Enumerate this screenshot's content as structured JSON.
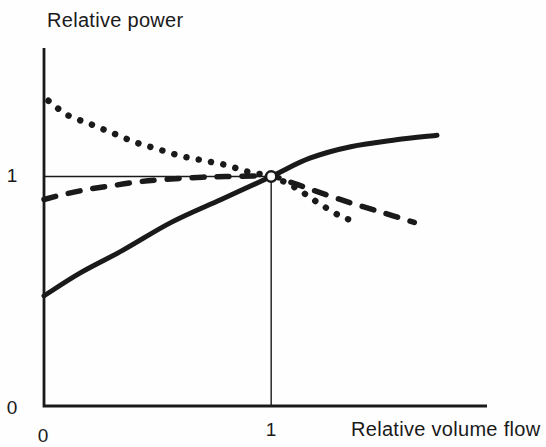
{
  "colors": {
    "ink": "#1a1a1a",
    "background": "#fefefe",
    "marker_fill": "#ffffff"
  },
  "chart_data": {
    "type": "line",
    "title": "",
    "ylabel": "Relative power",
    "xlabel": "Relative volume flow",
    "xlim": [
      0,
      1.95
    ],
    "ylim": [
      0,
      1.56
    ],
    "grid": false,
    "legend": "none",
    "x_ticks": [
      {
        "value": 0,
        "label": "0"
      },
      {
        "value": 1,
        "label": "1"
      }
    ],
    "y_ticks": [
      {
        "value": 0,
        "label": "0"
      },
      {
        "value": 1,
        "label": "1"
      }
    ],
    "reference_lines": [
      {
        "type": "horizontal",
        "y": 1,
        "from_x": 0,
        "to_x": 1
      },
      {
        "type": "vertical",
        "x": 1,
        "from_y": 0,
        "to_y": 1
      }
    ],
    "marker": {
      "x": 1,
      "y": 1,
      "shape": "open-circle"
    },
    "series": [
      {
        "name": "dotted curve",
        "style": "dotted",
        "points": [
          [
            0.02,
            1.33
          ],
          [
            0.1,
            1.27
          ],
          [
            0.2,
            1.23
          ],
          [
            0.3,
            1.19
          ],
          [
            0.4,
            1.15
          ],
          [
            0.5,
            1.12
          ],
          [
            0.6,
            1.09
          ],
          [
            0.7,
            1.07
          ],
          [
            0.8,
            1.05
          ],
          [
            0.9,
            1.02
          ],
          [
            1.0,
            1.0
          ],
          [
            1.1,
            0.955
          ],
          [
            1.2,
            0.89
          ],
          [
            1.3,
            0.83
          ],
          [
            1.38,
            0.8
          ]
        ]
      },
      {
        "name": "dashed curve",
        "style": "dashed",
        "points": [
          [
            0,
            0.9
          ],
          [
            0.1,
            0.925
          ],
          [
            0.2,
            0.945
          ],
          [
            0.3,
            0.96
          ],
          [
            0.4,
            0.975
          ],
          [
            0.5,
            0.985
          ],
          [
            0.65,
            0.995
          ],
          [
            0.8,
            1.0
          ],
          [
            1.0,
            1.0
          ],
          [
            1.1,
            0.97
          ],
          [
            1.2,
            0.935
          ],
          [
            1.35,
            0.885
          ],
          [
            1.5,
            0.84
          ],
          [
            1.63,
            0.8
          ]
        ]
      },
      {
        "name": "solid curve",
        "style": "solid",
        "points": [
          [
            0,
            0.48
          ],
          [
            0.16,
            0.58
          ],
          [
            0.35,
            0.68
          ],
          [
            0.56,
            0.8
          ],
          [
            0.78,
            0.9
          ],
          [
            1.0,
            1.0
          ],
          [
            1.17,
            1.08
          ],
          [
            1.35,
            1.13
          ],
          [
            1.55,
            1.16
          ],
          [
            1.73,
            1.18
          ]
        ]
      }
    ]
  }
}
